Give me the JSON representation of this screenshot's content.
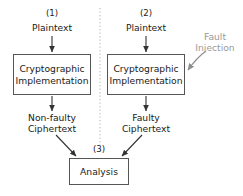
{
  "diagram": {
    "colors": {
      "stroke": "#555555",
      "text": "#1a1a1a",
      "annotation": "#9a9a9a",
      "background": "#ffffff",
      "divider": "#b0b0b0"
    },
    "step_tags": {
      "one": "(1)",
      "two": "(2)",
      "three": "(3)"
    },
    "branches": {
      "left": {
        "input_label": "Plaintext",
        "process_label": "Cryptographic\nImplementation",
        "output_label": "Non-faulty\nCiphertext"
      },
      "right": {
        "input_label": "Plaintext",
        "process_label": "Cryptographic\nImplementation",
        "output_label": "Faulty\nCiphertext"
      }
    },
    "analysis": {
      "label": "Analysis"
    },
    "annotation": {
      "fault_injection_label": "Fault\nInjection"
    }
  }
}
